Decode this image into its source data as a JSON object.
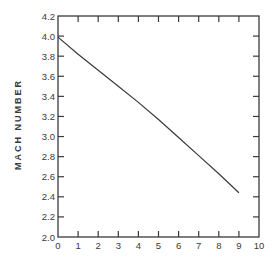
{
  "chart_data": {
    "type": "line",
    "title": "",
    "xlabel": "",
    "ylabel": "MACH NUMBER",
    "ylabel_words": [
      "MACH",
      "NUMBER"
    ],
    "xlim": [
      0,
      10
    ],
    "ylim": [
      2.0,
      4.2
    ],
    "grid": false,
    "legend": null,
    "x_ticks": [
      0,
      1,
      2,
      3,
      4,
      5,
      6,
      7,
      8,
      9,
      10
    ],
    "x_tick_labels": [
      "0",
      "1",
      "2",
      "3",
      "4",
      "5",
      "6",
      "7",
      "8",
      "9",
      "10"
    ],
    "y_ticks": [
      2.0,
      2.2,
      2.4,
      2.6,
      2.8,
      3.0,
      3.2,
      3.4,
      3.6,
      3.8,
      4.0,
      4.2
    ],
    "y_tick_labels": [
      "2.0",
      "2.2",
      "2.4",
      "2.6",
      "2.8",
      "3.0",
      "3.2",
      "3.4",
      "3.6",
      "3.8",
      "4.0",
      "4.2"
    ],
    "series": [
      {
        "name": "Mach number",
        "color": "#3a3a3a",
        "x": [
          0,
          1,
          2,
          3,
          4,
          5,
          6,
          7,
          8,
          9
        ],
        "values": [
          3.99,
          3.82,
          3.66,
          3.5,
          3.34,
          3.17,
          2.99,
          2.81,
          2.63,
          2.44
        ]
      }
    ]
  }
}
